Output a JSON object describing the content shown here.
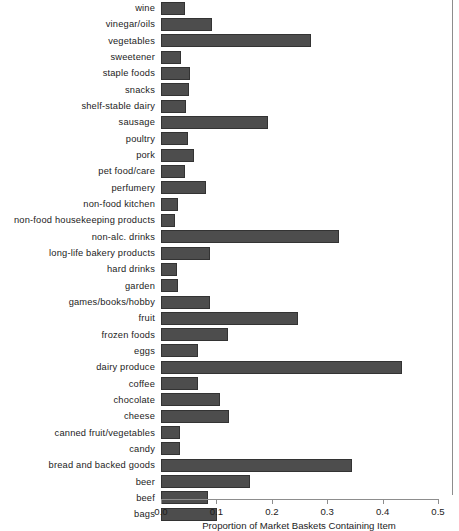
{
  "chart_data": {
    "type": "bar",
    "orientation": "horizontal",
    "title": "",
    "xlabel": "Proportion of Market Baskets Containing Item",
    "ylabel": "",
    "xlim": [
      0.0,
      0.5
    ],
    "xticks": [
      0.0,
      0.1,
      0.2,
      0.3,
      0.4,
      0.5
    ],
    "xtick_labels": [
      "0.0",
      "0.1",
      "0.2",
      "0.3",
      "0.4",
      "0.5"
    ],
    "grid": false,
    "legend": null,
    "bar_color": "#4d4d4d",
    "bar_edge_color": "#333333",
    "categories": [
      "wine",
      "vinegar/oils",
      "vegetables",
      "sweetener",
      "staple foods",
      "snacks",
      "shelf-stable dairy",
      "sausage",
      "poultry",
      "pork",
      "pet food/care",
      "perfumery",
      "non-food kitchen",
      "non-food housekeeping products",
      "non-alc. drinks",
      "long-life bakery products",
      "hard drinks",
      "garden",
      "games/books/hobby",
      "fruit",
      "frozen foods",
      "eggs",
      "dairy produce",
      "coffee",
      "chocolate",
      "cheese",
      "canned fruit/vegetables",
      "candy",
      "bread and backed goods",
      "beer",
      "beef",
      "bags"
    ],
    "values": [
      0.044,
      0.092,
      0.271,
      0.037,
      0.053,
      0.051,
      0.045,
      0.193,
      0.049,
      0.06,
      0.044,
      0.081,
      0.031,
      0.025,
      0.321,
      0.089,
      0.029,
      0.031,
      0.089,
      0.247,
      0.121,
      0.067,
      0.435,
      0.067,
      0.107,
      0.123,
      0.034,
      0.035,
      0.345,
      0.16,
      0.085,
      0.101
    ]
  }
}
